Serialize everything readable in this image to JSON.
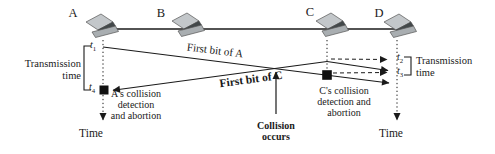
{
  "stations": [
    {
      "label": "A"
    },
    {
      "label": "B"
    },
    {
      "label": "C"
    },
    {
      "label": "D"
    }
  ],
  "brackets": {
    "left": {
      "line1": "Transmission",
      "line2": "time",
      "t_top": {
        "base": "t",
        "sub": "1"
      },
      "t_bottom": {
        "base": "t",
        "sub": "4"
      }
    },
    "right": {
      "line1": "Transmission",
      "line2": "time",
      "t_top": {
        "base": "t",
        "sub": "2"
      },
      "t_bottom": {
        "base": "t",
        "sub": "3"
      }
    }
  },
  "labels": {
    "first_bit_a": "First bit of A",
    "first_bit_c": "First bit of C",
    "a_collision": [
      "A's collision",
      "detection",
      "and abortion"
    ],
    "c_collision": [
      "C's collision",
      "detection and",
      "abortion"
    ],
    "collision": [
      "Collision",
      "occurs"
    ],
    "time_left": "Time",
    "time_right": "Time"
  },
  "colors": {
    "line": "#1a1a1a",
    "laptop_lid": "#c3c7ca",
    "laptop_screen": "#42484a",
    "laptop_base": "#a9aeb1"
  }
}
